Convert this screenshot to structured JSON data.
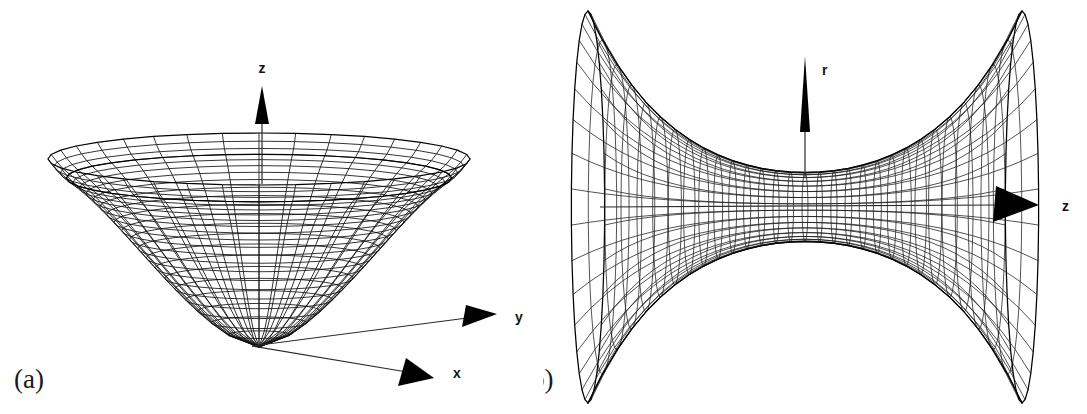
{
  "figure": {
    "background_color": "#ffffff",
    "ink_color": "#000000",
    "width": 1087,
    "height": 414,
    "style": "black-and-white line-art wireframe, scientific journal figure"
  },
  "panels": [
    {
      "id": "a",
      "label": "(a)",
      "label_position": {
        "x": 14,
        "y": 388
      },
      "surface_name": "funnel-embedding-surface",
      "description": "Wireframe surface of revolution: a deep funnel / paraboloid-like embedding diagram with a flared horizontal rim and a narrow rounded bottom, drawn in 3D oblique projection.",
      "axes": [
        {
          "name": "z",
          "label": "z",
          "direction": "up",
          "label_x": 262,
          "label_y": 73,
          "arrow": "solid-triangle"
        },
        {
          "name": "y",
          "label": "y",
          "direction": "right",
          "label_x": 515,
          "label_y": 322,
          "arrow": "solid-triangle"
        },
        {
          "name": "x",
          "label": "x",
          "direction": "lower-right",
          "label_x": 453,
          "label_y": 372,
          "arrow": "solid-triangle"
        }
      ],
      "mesh": {
        "meridians": 36,
        "parallels": 22,
        "rim_center": {
          "x": 259,
          "y": 170
        },
        "rim_radius_x": 211,
        "rim_radius_y": 26,
        "throat_bottom": {
          "x": 249,
          "y": 347
        }
      }
    },
    {
      "id": "b",
      "label": "(b)",
      "label_position": {
        "x": 522,
        "y": 388
      },
      "surface_name": "catenoid-hyperboloid-surface",
      "description": "Wireframe catenoid / hyperboloid of revolution shown as an hourglass with two flared lobes on the left and right, joined by a narrow central waist (throat).",
      "axes": [
        {
          "name": "r",
          "label": "r",
          "direction": "up",
          "label_x": 822,
          "label_y": 75,
          "arrow": "slender-triangle"
        },
        {
          "name": "z",
          "label": "z",
          "direction": "right",
          "label_x": 1062,
          "label_y": 209,
          "arrow": "solid-triangle"
        }
      ],
      "mesh": {
        "meridians": 34,
        "parallels": 30,
        "waist_center": {
          "x": 805,
          "y": 207
        },
        "waist_half_height": 30,
        "left_edge": 588,
        "right_edge": 1022,
        "top_edge": 10,
        "bottom_edge": 402
      }
    }
  ],
  "chart_data": {
    "type": "line",
    "title": "",
    "subtitle": "",
    "xlabel": "",
    "ylabel": "",
    "charts": [
      {
        "panel": "a",
        "kind": "3d-wireframe-surface-of-revolution",
        "surface": "funnel / Flamm paraboloid embedding diagram",
        "axis_names": [
          "x",
          "y",
          "z"
        ],
        "profile_description": "radius grows rapidly with height; narrow throat at the bottom opening to a wide flat rim at the top",
        "grid": true,
        "legend": "none"
      },
      {
        "panel": "b",
        "kind": "3d-wireframe-surface-of-revolution",
        "surface": "catenoid / hyperboloid of one sheet",
        "axis_names": [
          "r",
          "z"
        ],
        "profile_description": "r = a*cosh(z/a): minimum radius at the central waist, flaring symmetrically outward in both +z and -z directions",
        "grid": true,
        "legend": "none"
      }
    ]
  }
}
